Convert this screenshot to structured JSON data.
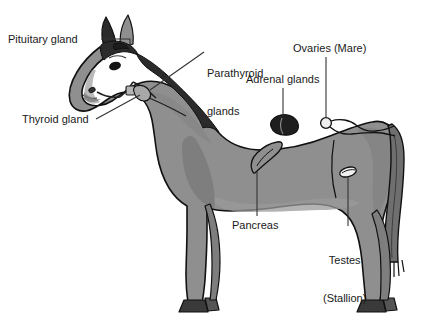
{
  "figure": {
    "colors": {
      "background": "#ffffff",
      "body_fill": "#8f8f8f",
      "body_shade": "#7e7e7e",
      "body_light": "#9a9a9a",
      "dark_parts": "#2b2b2b",
      "tail_fill": "#6f6f6f",
      "outline": "#111111",
      "label_text": "#1a1a1a",
      "leader_line": "#333333",
      "organ_dark": "#262626",
      "organ_light": "#f2f2f2"
    },
    "labels": [
      {
        "id": "pituitary",
        "text": "Pituitary gland",
        "lines": [
          "Pituitary gland"
        ]
      },
      {
        "id": "thyroid",
        "text": "Thyroid gland",
        "lines": [
          "Thyroid gland"
        ]
      },
      {
        "id": "parathyroid",
        "text": "Parathyroid glands",
        "lines": [
          "Parathyroid",
          "glands"
        ]
      },
      {
        "id": "adrenal",
        "text": "Adrenal glands",
        "lines": [
          "Adrenal glands"
        ]
      },
      {
        "id": "ovaries",
        "text": "Ovaries (Mare)",
        "lines": [
          "Ovaries (Mare)"
        ]
      },
      {
        "id": "pancreas",
        "text": "Pancreas",
        "lines": [
          "Pancreas"
        ]
      },
      {
        "id": "testes",
        "text": "Testes (Stallion)",
        "lines": [
          "Testes",
          "(Stallion)"
        ]
      }
    ],
    "label_text": {
      "pituitary": "Pituitary gland",
      "thyroid": "Thyroid gland",
      "parathyroid_line1": "Parathyroid",
      "parathyroid_line2": "glands",
      "adrenal": "Adrenal glands",
      "ovaries": "Ovaries (Mare)",
      "pancreas": "Pancreas",
      "testes_line1": "Testes",
      "testes_line2": "(Stallion)"
    },
    "organs": [
      {
        "id": "pituitary-marker",
        "shape": "dark-teardrop",
        "x": 118,
        "y": 47
      },
      {
        "id": "thyroid-marker",
        "shape": "small-nodule",
        "x": 141,
        "y": 92
      },
      {
        "id": "parathyroid-marker",
        "shape": "small-nodule",
        "x": 141,
        "y": 92
      },
      {
        "id": "adrenal-marker",
        "shape": "dark-bean",
        "x": 283,
        "y": 124
      },
      {
        "id": "ovary-marker",
        "shape": "light-circle",
        "x": 326,
        "y": 123
      },
      {
        "id": "pancreas-marker",
        "shape": "outlined-lobe",
        "x": 262,
        "y": 155
      },
      {
        "id": "testes-marker",
        "shape": "light-oval",
        "x": 348,
        "y": 172
      }
    ]
  }
}
